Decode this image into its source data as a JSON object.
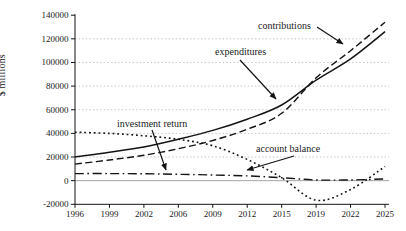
{
  "figure": {
    "ylabel": "$ millions"
  },
  "chart_data": {
    "type": "line",
    "title": "",
    "xlabel": "",
    "ylabel": "$ millions",
    "grid": "horizontal dotted gridlines at each 20000 step, solid gray line at 0",
    "legend": "inline annotations with arrows",
    "x_tick_labels": [
      "1996",
      "1999",
      "2002",
      "2006",
      "2009",
      "2012",
      "2015",
      "2019",
      "2022",
      "2025"
    ],
    "y_tick_labels": [
      "-20000",
      "0",
      "20000",
      "40000",
      "60000",
      "80000",
      "100000",
      "120000",
      "140000"
    ],
    "y_ticks": [
      -20000,
      0,
      20000,
      40000,
      60000,
      80000,
      100000,
      120000,
      140000
    ],
    "ylim": [
      -20000,
      140000
    ],
    "xlim_years": [
      1996,
      2025
    ],
    "line_color": "#141414",
    "series": [
      {
        "name": "contributions",
        "style": "dashed",
        "values": [
          14000,
          17500,
          21500,
          27000,
          34000,
          43500,
          57000,
          87000,
          110000,
          134000
        ]
      },
      {
        "name": "expenditures",
        "style": "solid",
        "values": [
          20000,
          24000,
          28500,
          35000,
          42500,
          52000,
          64000,
          85000,
          103000,
          126000
        ]
      },
      {
        "name": "investment return",
        "style": "dash-dot",
        "values": [
          6000,
          6000,
          5800,
          5400,
          4800,
          4000,
          2500,
          600,
          600,
          1500
        ]
      },
      {
        "name": "account balance",
        "style": "dotted",
        "values": [
          41000,
          40000,
          38000,
          35000,
          29500,
          18000,
          2500,
          -16500,
          -7500,
          12000
        ]
      }
    ],
    "annotations": [
      {
        "label": "contributions",
        "target": "contributions (dashed line)",
        "text_x": 258,
        "text_y": 29,
        "arrow": [
          317,
          27,
          343,
          44
        ]
      },
      {
        "label": "expenditures",
        "target": "expenditures (solid line)",
        "text_x": 215,
        "text_y": 55,
        "arrow": [
          240,
          60,
          276,
          99
        ]
      },
      {
        "label": "investment return",
        "target": "investment return (dash-dot line)",
        "text_x": 117,
        "text_y": 127,
        "arrow": [
          152,
          130,
          166,
          170
        ]
      },
      {
        "label": "account balance",
        "target": "account balance (dotted line)",
        "text_x": 256,
        "text_y": 152,
        "arrow": [
          294,
          156,
          247,
          170
        ]
      }
    ]
  }
}
